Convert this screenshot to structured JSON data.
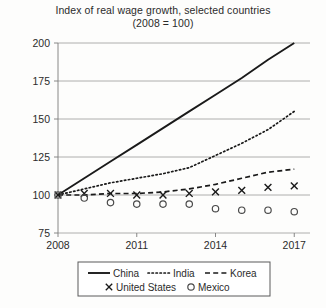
{
  "chart_data": {
    "type": "line",
    "title": "Index of real wage growth, selected countries",
    "subtitle": "(2008 = 100)",
    "xlabel": "",
    "ylabel": "",
    "x": [
      2008,
      2009,
      2010,
      2011,
      2012,
      2013,
      2014,
      2015,
      2016,
      2017
    ],
    "xticks": [
      "2008",
      "2011",
      "2014",
      "2017"
    ],
    "xtick_values": [
      2008,
      2011,
      2014,
      2017
    ],
    "yticks": [
      "75",
      "100",
      "125",
      "150",
      "175",
      "200"
    ],
    "ytick_values": [
      75,
      100,
      125,
      150,
      175,
      200
    ],
    "ylim": [
      75,
      200
    ],
    "xlim": [
      2008,
      2017.6
    ],
    "grid": true,
    "legend_position": "below-center",
    "series": [
      {
        "name": "China",
        "style": "solid",
        "marker": "none",
        "color": "#1a1a1a",
        "values": [
          100,
          111,
          122,
          133,
          144,
          155,
          166,
          177,
          189,
          200
        ]
      },
      {
        "name": "India",
        "style": "dotted",
        "marker": "none",
        "color": "#1a1a1a",
        "values": [
          100,
          104,
          108,
          111,
          114,
          118,
          126,
          134,
          143,
          155
        ]
      },
      {
        "name": "Korea",
        "style": "dashed",
        "marker": "none",
        "color": "#1a1a1a",
        "values": [
          100,
          100,
          101,
          101,
          102,
          104,
          107,
          111,
          115,
          117
        ]
      },
      {
        "name": "United States",
        "style": "none",
        "marker": "x",
        "color": "#1a1a1a",
        "values": [
          100,
          101,
          101,
          100,
          100,
          101,
          102,
          103,
          105,
          106
        ]
      },
      {
        "name": "Mexico",
        "style": "none",
        "marker": "o",
        "color": "#4a4a4a",
        "values": [
          100,
          98,
          95,
          94,
          94,
          94,
          91,
          90,
          90,
          89
        ]
      }
    ]
  },
  "legend": {
    "items": [
      {
        "label": "China",
        "key": "legend-item-china"
      },
      {
        "label": "India",
        "key": "legend-item-india"
      },
      {
        "label": "Korea",
        "key": "legend-item-korea"
      },
      {
        "label": "United States",
        "key": "legend-item-united-states"
      },
      {
        "label": "Mexico",
        "key": "legend-item-mexico"
      }
    ]
  }
}
